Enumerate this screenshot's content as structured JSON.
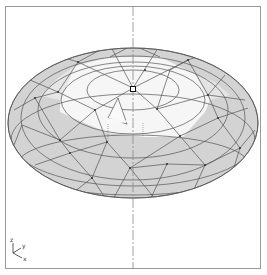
{
  "viewport": {
    "name": "3D geodesic dome view",
    "colors": {
      "frame": "#9a9a9a",
      "shaded_face": "#d3d3d3",
      "lit_face": "#f6f6f6",
      "edge": "#555555",
      "centerline": "#888888"
    }
  },
  "axis_triad": {
    "labels": [
      "z",
      "y",
      "x"
    ]
  },
  "model": {
    "type": "geodesic-dome",
    "selected_vertex": "apex",
    "cursor": "arrow-pointer"
  }
}
